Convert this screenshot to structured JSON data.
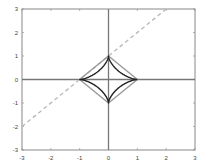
{
  "chart_data": {
    "type": "line",
    "title": "",
    "xlabel": "",
    "ylabel": "",
    "xlim": [
      -3,
      3
    ],
    "ylim": [
      -3,
      3
    ],
    "grid": false,
    "legend": null,
    "xticks": [
      "-3",
      "-2",
      "-1",
      "0",
      "1",
      "2",
      "3"
    ],
    "yticks": [
      "3",
      "2",
      "1",
      "0",
      "-1",
      "-2",
      "-3"
    ],
    "series": [
      {
        "name": "astroid |x|^(2/3)+|y|^(2/3)=1",
        "color": "#222222",
        "style": "solid",
        "description": "closed concave star curve with cusps at (1,0),(0,1),(-1,0),(0,-1)"
      },
      {
        "name": "diamond |x|+|y|=1",
        "color": "#999999",
        "style": "solid",
        "points": [
          [
            1,
            0
          ],
          [
            0,
            1
          ],
          [
            -1,
            0
          ],
          [
            0,
            -1
          ],
          [
            1,
            0
          ]
        ]
      },
      {
        "name": "line y = x + 1",
        "color": "#bbbbbb",
        "style": "dashed",
        "points": [
          [
            -3,
            -2
          ],
          [
            2,
            3
          ]
        ]
      },
      {
        "name": "x-axis",
        "color": "#777777",
        "style": "solid",
        "points": [
          [
            -3,
            0
          ],
          [
            3,
            0
          ]
        ]
      },
      {
        "name": "y-axis",
        "color": "#777777",
        "style": "solid",
        "points": [
          [
            0,
            -3
          ],
          [
            0,
            3
          ]
        ]
      }
    ]
  },
  "colors": {
    "frame": "#888888",
    "axes": "#777777",
    "astroid": "#222222",
    "diamond": "#999999",
    "dashed": "#bbbbbb"
  }
}
